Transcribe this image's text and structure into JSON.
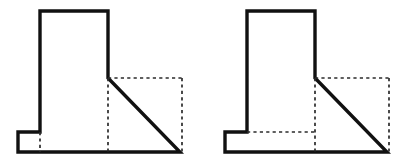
{
  "canvas": {
    "width": 414,
    "height": 164,
    "background_color": "#ffffff"
  },
  "style": {
    "solid_line_color": "#111111",
    "hidden_line_color": "#2b2b2b",
    "solid_line_width": 3.4,
    "hidden_line_width": 1.7,
    "hidden_dash_pattern": "3.2 3.2"
  },
  "figures": [
    {
      "id": "figure-left",
      "name": "left-orthographic-view",
      "origin_x": 0,
      "solid_outline_points": "18,152 18,132 40,132 40,11 108,11 108,78 180,152 18,152",
      "hidden_edges": [
        {
          "name": "hidden-edge-dashed-top-right",
          "points": "108,78 182,78"
        },
        {
          "name": "hidden-edge-dashed-right-vertical",
          "points": "182,78 182,152"
        },
        {
          "name": "hidden-edge-dashed-mid-vertical",
          "points": "108,78 108,152"
        },
        {
          "name": "hidden-edge-dashed-foot-vertical",
          "points": "40,132 40,152"
        }
      ]
    },
    {
      "id": "figure-right",
      "name": "right-orthographic-view",
      "origin_x": 207,
      "solid_outline_points": "18,152 18,132 40,132 40,11 108,11 108,78 180,152 18,152",
      "hidden_edges": [
        {
          "name": "hidden-edge-dashed-top-right",
          "points": "108,78 182,78"
        },
        {
          "name": "hidden-edge-dashed-right-vertical",
          "points": "182,78 182,152"
        },
        {
          "name": "hidden-edge-dashed-mid-vertical",
          "points": "108,78 108,152"
        },
        {
          "name": "hidden-edge-dashed-foot-horizontal",
          "points": "40,132 108,132"
        }
      ]
    }
  ]
}
